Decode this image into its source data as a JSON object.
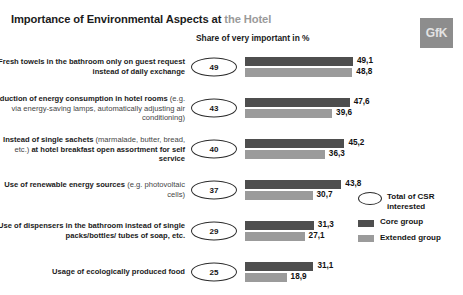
{
  "header": {
    "title_main": "Importance of Environmental Aspects at ",
    "title_accent": "the Hotel",
    "subtitle": "Share of very important in %",
    "logo_text": "GfK"
  },
  "legend": {
    "total_label": "Total of CSR interested",
    "core_label": "Core group",
    "extended_label": "Extended group"
  },
  "colors": {
    "core": "#4e4e4e",
    "extended": "#9b9b9b",
    "title_main": "#1b1b1b",
    "title_accent": "#9a9a9a",
    "logo_bg": "#8d8d8d"
  },
  "chart_data": {
    "type": "bar",
    "title": "Importance of Environmental Aspects at the Hotel",
    "subtitle": "Share of very important in %",
    "orientation": "horizontal",
    "xlabel": "",
    "ylabel": "",
    "xlim": [
      0,
      50
    ],
    "grid": false,
    "legend_position": "right",
    "categories": [
      "Fresh towels in the bathroom only on guest request instead of daily exchange",
      "Reduction of energy consumption in hotel rooms (e.g. via energy-saving lamps, automatically adjusting air conditioning)",
      "Instead of single sachets (marmalade, butter, bread, etc.) at hotel breakfast open assortment for self service",
      "Use of renewable energy sources (e.g. photovoltaic cells)",
      "Use of dispensers in the bathroom instead of single packs/bottles/ tubes of soap, etc.",
      "Usage of ecologically produced food"
    ],
    "series": [
      {
        "name": "Total of CSR interested",
        "values": [
          49,
          43,
          40,
          37,
          29,
          25
        ],
        "display": [
          "49",
          "43",
          "40",
          "37",
          "29",
          "25"
        ],
        "render": "bubble"
      },
      {
        "name": "Core group",
        "values": [
          49.1,
          47.6,
          45.2,
          43.8,
          31.3,
          31.1
        ],
        "display": [
          "49,1",
          "47,6",
          "45,2",
          "43,8",
          "31,3",
          "31,1"
        ]
      },
      {
        "name": "Extended group",
        "values": [
          48.8,
          39.6,
          36.3,
          30.7,
          27.1,
          18.9
        ],
        "display": [
          "48,8",
          "39,6",
          "36,3",
          "30,7",
          "27,1",
          "18,9"
        ]
      }
    ]
  },
  "rows": [
    {
      "label_html": "Fresh towels in the bathroom only on guest request instead of daily exchange",
      "parts": [
        {
          "t": "Fresh towels in the bathroom only on guest request instead of daily exchange",
          "b": true
        }
      ]
    },
    {
      "label_html": "Reduction of energy consumption in hotel rooms (e.g. via energy-saving lamps, automatically adjusting air conditioning)",
      "parts": [
        {
          "t": "Reduction of energy consumption in hotel rooms ",
          "b": true
        },
        {
          "t": "(e.g. via energy-saving lamps, automatically adjusting air conditioning)",
          "b": false
        }
      ]
    },
    {
      "label_html": "Instead of single sachets (marmalade, butter, bread, etc.) at hotel breakfast open assortment for self service",
      "parts": [
        {
          "t": "Instead of single sachets ",
          "b": true
        },
        {
          "t": "(marmalade, butter, bread, etc.) ",
          "b": false
        },
        {
          "t": "at hotel breakfast open assortment for self service",
          "b": true
        }
      ]
    },
    {
      "label_html": "Use of renewable energy sources (e.g. photovoltaic cells)",
      "parts": [
        {
          "t": "Use of renewable energy sources ",
          "b": true
        },
        {
          "t": "(e.g. photovoltaic cells)",
          "b": false
        }
      ]
    },
    {
      "label_html": "Use of dispensers in the bathroom instead of single packs/bottles/ tubes of soap, etc.",
      "parts": [
        {
          "t": "Use of dispensers in the bathroom instead of single packs/bottles/ tubes of soap, etc.",
          "b": true
        }
      ]
    },
    {
      "label_html": "Usage of ecologically produced food",
      "parts": [
        {
          "t": "Usage of ecologically produced food",
          "b": true
        }
      ]
    }
  ]
}
